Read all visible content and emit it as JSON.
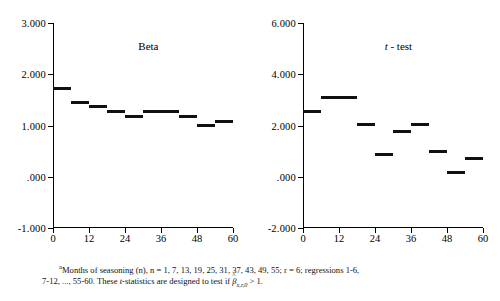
{
  "figure": {
    "footnote_marker": "a",
    "footnote_line1": "Months of seasoning (n), n = 1, 7, 13, 19, 25, 31, 37, 43, 49, 55; r = 6; regressions 1-6,",
    "footnote_line2_pre": "7-12, ..., 55-60. These ",
    "footnote_line2_t": "t",
    "footnote_line2_mid": "-statistics are designed to test if ",
    "footnote_beta": "β",
    "footnote_beta_sub": "x,r,0",
    "footnote_line2_end": " > 1."
  },
  "chart_data": [
    {
      "type": "bar",
      "title": "Beta",
      "title_italic_prefix": "",
      "xlabel": "",
      "ylabel": "",
      "x": [
        0,
        6,
        12,
        18,
        24,
        30,
        36,
        42,
        48,
        54
      ],
      "bar_width_months": 6,
      "values": [
        1.72,
        1.45,
        1.37,
        1.27,
        1.17,
        1.27,
        1.17,
        1.0,
        1.08
      ],
      "categories": [
        "0-6",
        "6-12",
        "12-18",
        "18-24",
        "24-30",
        "30-42",
        "42-48",
        "48-54",
        "54-60"
      ],
      "bar_spans": [
        [
          0,
          6
        ],
        [
          6,
          12
        ],
        [
          12,
          18
        ],
        [
          18,
          24
        ],
        [
          24,
          30
        ],
        [
          30,
          42
        ],
        [
          42,
          48
        ],
        [
          48,
          54
        ],
        [
          54,
          60
        ]
      ],
      "xlim": [
        0,
        60
      ],
      "ylim": [
        -1.0,
        3.0
      ],
      "yticks": [
        3.0,
        2.0,
        1.0,
        0.0,
        -1.0
      ],
      "ytick_labels": [
        "3.000",
        "2.000",
        "1.000",
        ".000",
        "-1.000"
      ],
      "xticks": [
        0,
        12,
        24,
        36,
        48,
        60
      ],
      "xtick_labels": [
        "0",
        "12",
        "24",
        "36",
        "48",
        "60"
      ],
      "grid": false,
      "legend": "none"
    },
    {
      "type": "bar",
      "title": "t - test",
      "title_italic_prefix": "t",
      "xlabel": "",
      "ylabel": "",
      "x": [
        0,
        6,
        18,
        24,
        30,
        36,
        42,
        48,
        54
      ],
      "bar_width_months": 6,
      "values": [
        2.55,
        3.1,
        2.05,
        0.88,
        1.78,
        2.03,
        1.0,
        0.15,
        0.72
      ],
      "categories": [
        "0-6",
        "6-18",
        "18-24",
        "24-30",
        "30-36",
        "36-42",
        "42-48",
        "48-54",
        "54-60"
      ],
      "bar_spans": [
        [
          0,
          6
        ],
        [
          6,
          18
        ],
        [
          18,
          24
        ],
        [
          24,
          30
        ],
        [
          30,
          36
        ],
        [
          36,
          42
        ],
        [
          42,
          48
        ],
        [
          48,
          54
        ],
        [
          54,
          60
        ]
      ],
      "xlim": [
        0,
        60
      ],
      "ylim": [
        -2.0,
        6.0
      ],
      "yticks": [
        6.0,
        4.0,
        2.0,
        0.0,
        -2.0
      ],
      "ytick_labels": [
        "6.000",
        "4.000",
        "2.000",
        ".000",
        "-2.000"
      ],
      "xticks": [
        0,
        12,
        24,
        36,
        48,
        60
      ],
      "xtick_labels": [
        "0",
        "12",
        "24",
        "36",
        "48",
        "60"
      ],
      "grid": false,
      "legend": "none"
    }
  ]
}
